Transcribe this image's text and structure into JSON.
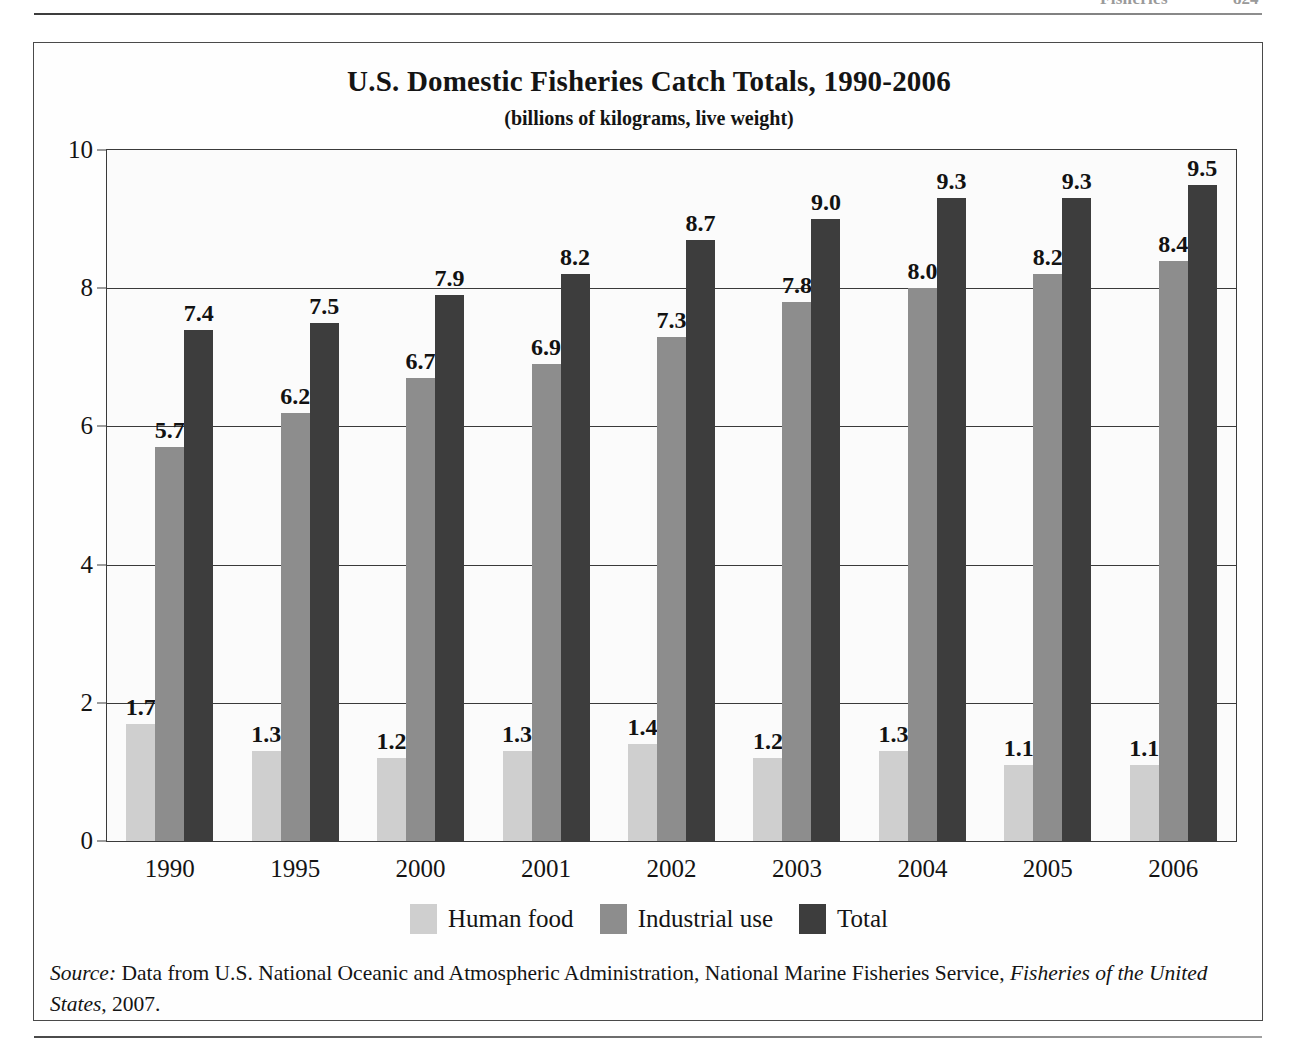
{
  "running_header": {
    "section": "Fisheries",
    "page_number": "824"
  },
  "figure": {
    "title": "U.S. Domestic Fisheries Catch Totals, 1990-2006",
    "subtitle": "(billions of kilograms, live weight)",
    "source_prefix": "Source:",
    "source_text": " Data from U.S. National Oceanic and Atmospheric Administration, National Marine Fisheries Service, ",
    "source_publication": "Fisheries of the United States",
    "source_tail": ", 2007."
  },
  "legend": {
    "items": [
      {
        "label": "Human food",
        "swatch": "human",
        "color": "#cfcfcf"
      },
      {
        "label": "Industrial use",
        "swatch": "industrial",
        "color": "#8d8d8d"
      },
      {
        "label": "Total",
        "swatch": "total",
        "color": "#3d3d3d"
      }
    ]
  },
  "chart_data": {
    "type": "bar",
    "title": "U.S. Domestic Fisheries Catch Totals, 1990-2006",
    "subtitle": "(billions of kilograms, live weight)",
    "xlabel": "",
    "ylabel": "",
    "ylim": [
      0,
      10
    ],
    "yticks": [
      0,
      2,
      4,
      6,
      8,
      10
    ],
    "ytick_labels": [
      "0",
      "2",
      "4",
      "6",
      "8",
      "10"
    ],
    "grid": true,
    "legend_position": "bottom",
    "categories": [
      "1990",
      "1995",
      "2000",
      "2001",
      "2002",
      "2003",
      "2004",
      "2005",
      "2006"
    ],
    "series": [
      {
        "name": "Human food",
        "color": "#cfcfcf",
        "values": [
          1.7,
          1.3,
          1.2,
          1.3,
          1.4,
          1.2,
          1.3,
          1.1,
          1.1
        ],
        "labels": [
          "1.7",
          "1.3",
          "1.2",
          "1.3",
          "1.4",
          "1.2",
          "1.3",
          "1.1",
          "1.1"
        ]
      },
      {
        "name": "Industrial use",
        "color": "#8d8d8d",
        "values": [
          5.7,
          6.2,
          6.7,
          6.9,
          7.3,
          7.8,
          8.0,
          8.2,
          8.4
        ],
        "labels": [
          "5.7",
          "6.2",
          "6.7",
          "6.9",
          "7.3",
          "7.8",
          "8.0",
          "8.2",
          "8.4"
        ]
      },
      {
        "name": "Total",
        "color": "#3d3d3d",
        "values": [
          7.4,
          7.5,
          7.9,
          8.2,
          8.7,
          9.0,
          9.3,
          9.3,
          9.5
        ],
        "labels": [
          "7.4",
          "7.5",
          "7.9",
          "8.2",
          "8.7",
          "9.0",
          "9.3",
          "9.3",
          "9.5"
        ]
      }
    ]
  }
}
